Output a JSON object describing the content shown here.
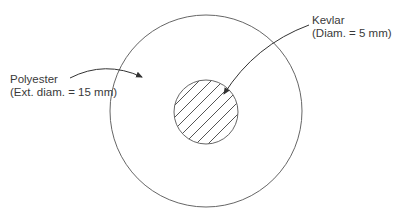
{
  "diagram": {
    "type": "cross-section",
    "outer": {
      "material": "Polyester",
      "spec": "(Ext. diam. = 15 mm)"
    },
    "inner": {
      "material": "Kevlar",
      "spec": "(Diam. = 5 mm)"
    },
    "colors": {
      "stroke": "#555555",
      "background": "#ffffff",
      "text": "#3a3a3a"
    }
  }
}
